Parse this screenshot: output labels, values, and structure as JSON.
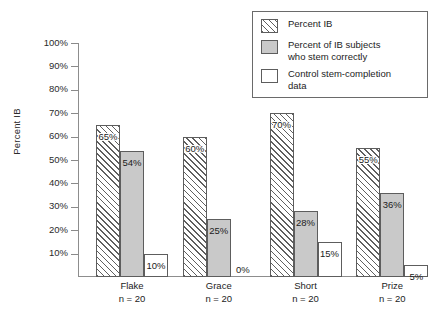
{
  "chart_data": {
    "type": "bar",
    "title": "",
    "xlabel": "",
    "ylabel": "Percent IB",
    "ylim": [
      0,
      100
    ],
    "yticks": [
      "100%",
      "90%",
      "80%",
      "70%",
      "60%",
      "50%",
      "40%",
      "30%",
      "20%",
      "10%"
    ],
    "ytick_values": [
      100,
      90,
      80,
      70,
      60,
      50,
      40,
      30,
      20,
      10
    ],
    "grid": false,
    "legend_position": "top-right",
    "categories": [
      "Flake",
      "Grace",
      "Short",
      "Prize"
    ],
    "category_sublabels": [
      "n = 20",
      "n = 20",
      "n = 20",
      "n = 20"
    ],
    "series": [
      {
        "name": "Percent IB",
        "style": "hatch",
        "values": [
          65,
          60,
          70,
          55
        ],
        "labels": [
          "65%",
          "60%",
          "70%",
          "55%"
        ]
      },
      {
        "name": "Percent of IB subjects\nwho stem correctly",
        "style": "solid",
        "values": [
          54,
          25,
          28,
          36
        ],
        "labels": [
          "54%",
          "25%",
          "28%",
          "36%"
        ]
      },
      {
        "name": "Control stem-completion\ndata",
        "style": "open",
        "values": [
          10,
          0,
          15,
          5
        ],
        "labels": [
          "10%",
          "0%",
          "15%",
          "5%"
        ]
      }
    ]
  },
  "legend": {
    "items": [
      {
        "label": "Percent IB",
        "style": "hatch"
      },
      {
        "label": "Percent of IB subjects\nwho stem correctly",
        "style": "solid"
      },
      {
        "label": "Control stem-completion\ndata",
        "style": "open"
      }
    ]
  },
  "colors": {
    "solid_fill": "#c9c9c9",
    "hatch_line": "#5f5f5f",
    "bar_border": "#5d5d5d",
    "axis": "#8d8d8d",
    "text": "#1c1c1c",
    "background": "#ffffff"
  }
}
